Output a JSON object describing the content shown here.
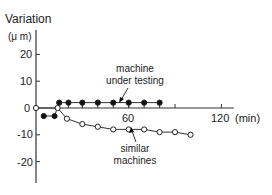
{
  "chart_data": {
    "type": "line",
    "title": "",
    "ylabel": "Variation",
    "yunit": "(μ m)",
    "xlabel": "",
    "xunit": "(min)",
    "ylim": [
      -28,
      28
    ],
    "xlim": [
      0,
      128
    ],
    "yticks": [
      20,
      10,
      0,
      -10,
      -20
    ],
    "xticks": [
      30,
      60,
      90,
      120
    ],
    "xtick_labels": {
      "60": "60",
      "120": "120"
    },
    "grid": false,
    "series": [
      {
        "name": "machine under testing",
        "marker": "filled-circle",
        "x": [
          5,
          12,
          15,
          21,
          30,
          40,
          50,
          60,
          70,
          80
        ],
        "y": [
          -3,
          -3,
          2,
          2,
          2,
          2,
          2,
          2,
          2,
          2
        ]
      },
      {
        "name": "similar machines",
        "marker": "open-circle",
        "x": [
          0,
          14,
          20,
          30,
          40,
          50,
          60,
          70,
          80,
          90,
          100
        ],
        "y": [
          0,
          0,
          -4,
          -6,
          -7,
          -8,
          -8,
          -8,
          -9,
          -9,
          -10
        ]
      }
    ],
    "annotations": [
      {
        "text_lines": [
          "machine",
          "under testing"
        ],
        "points_to": "machine under testing"
      },
      {
        "text_lines": [
          "similar",
          "machines"
        ],
        "points_to": "similar machines"
      }
    ]
  },
  "labels": {
    "ylabel": "Variation",
    "yunit": "(μ m)",
    "xunit": "(min)",
    "ytick_20": "20",
    "ytick_10": "10",
    "ytick_0": "0",
    "ytick_m10": "-10",
    "ytick_m20": "-20",
    "xtick_60": "60",
    "xtick_120": "120",
    "ann_machine_1": "machine",
    "ann_machine_2": "under testing",
    "ann_similar_1": "similar",
    "ann_similar_2": "machines"
  }
}
